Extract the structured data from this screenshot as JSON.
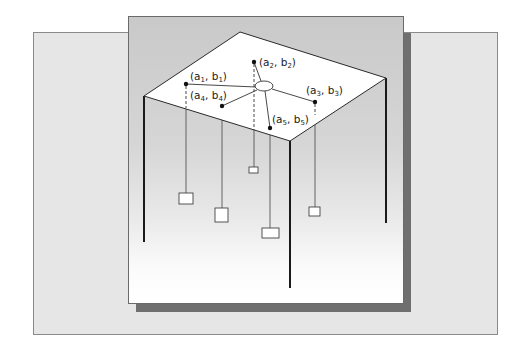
{
  "figure": {
    "points": [
      {
        "id": "p1",
        "label_a": "a",
        "sub_a": "1",
        "label_b": "b",
        "sub_b": "1"
      },
      {
        "id": "p2",
        "label_a": "a",
        "sub_a": "2",
        "label_b": "b",
        "sub_b": "2"
      },
      {
        "id": "p3",
        "label_a": "a",
        "sub_a": "3",
        "label_b": "b",
        "sub_b": "3"
      },
      {
        "id": "p4",
        "label_a": "a",
        "sub_a": "4",
        "label_b": "b",
        "sub_b": "4"
      },
      {
        "id": "p5",
        "label_a": "a",
        "sub_a": "5",
        "label_b": "b",
        "sub_b": "5"
      }
    ],
    "punct": {
      "open": "(",
      "comma": ", ",
      "close": ")"
    },
    "colors": {
      "back_panel": "#e6e6e6",
      "front_panel_top": "#c9c9c9",
      "shadow": "#6f6f6f",
      "table_top": "#ffffff",
      "lines": "#222222"
    }
  }
}
